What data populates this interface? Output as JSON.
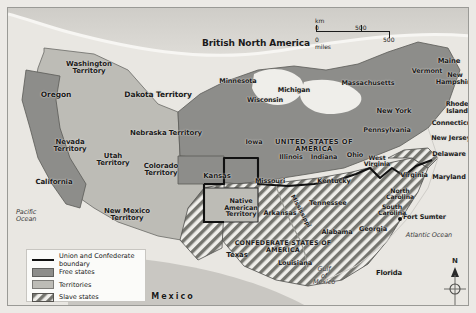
{
  "map": {
    "title_country_north": "British North America",
    "country_usa": "UNITED STATES OF AMERICA",
    "country_csa": "CONFEDERATE STATES OF AMERICA",
    "country_mexico": "Mexico",
    "oceans": [
      {
        "name": "Pacific Ocean",
        "label": "Pacific\nOcean"
      },
      {
        "name": "Atlantic Ocean",
        "label": "Atlantic Ocean"
      },
      {
        "name": "Gulf of Mexico",
        "label": "Gulf\nof\nMexico"
      }
    ],
    "river": "Mississippi",
    "marker": {
      "label": "Fort Sumter"
    },
    "free_states": [
      "Oregon",
      "California",
      "Minnesota",
      "Wisconsin",
      "Michigan",
      "Iowa",
      "Illinois",
      "Indiana",
      "Ohio",
      "Pennsylvania",
      "New York",
      "Vermont",
      "Massachusetts",
      "Maine",
      "New Hampshire",
      "Rhode Island",
      "Connecticut",
      "New Jersey",
      "Kansas",
      "West Virginia"
    ],
    "slave_states": [
      "Missouri",
      "Kentucky",
      "Tennessee",
      "Arkansas",
      "Louisiana",
      "Texas",
      "Mississippi",
      "Alabama",
      "Georgia",
      "Florida",
      "South Carolina",
      "North Carolina",
      "Virginia",
      "Maryland",
      "Delaware"
    ],
    "territories": [
      "Washington Territory",
      "Dakota Territory",
      "Nebraska Territory",
      "Nevada Territory",
      "Utah Territory",
      "Colorado Territory",
      "New Mexico Territory",
      "Native American Territory"
    ],
    "labels": [
      {
        "name": "washington-territory",
        "text": "Washington\nTerritory",
        "x": 50,
        "y": 53,
        "w": 62,
        "size": 7
      },
      {
        "name": "oregon",
        "text": "Oregon",
        "x": 20,
        "y": 83,
        "w": 56,
        "size": 7.5
      },
      {
        "name": "dakota-territory",
        "text": "Dakota Territory",
        "x": 108,
        "y": 83,
        "w": 84,
        "size": 7.5
      },
      {
        "name": "minnesota",
        "text": "Minnesota",
        "x": 203,
        "y": 70,
        "w": 54,
        "size": 6.5
      },
      {
        "name": "wisconsin",
        "text": "Wisconsin",
        "x": 232,
        "y": 89,
        "w": 50,
        "size": 6.5
      },
      {
        "name": "michigan",
        "text": "Michigan",
        "x": 262,
        "y": 79,
        "w": 48,
        "size": 6.5
      },
      {
        "name": "nebraska-territory",
        "text": "Nebraska Territory",
        "x": 112,
        "y": 122,
        "w": 92,
        "size": 7
      },
      {
        "name": "nevada-territory",
        "text": "Nevada\nTerritory",
        "x": 36,
        "y": 131,
        "w": 52,
        "size": 7
      },
      {
        "name": "utah-territory",
        "text": "Utah\nTerritory",
        "x": 80,
        "y": 145,
        "w": 50,
        "size": 7
      },
      {
        "name": "colorado-territory",
        "text": "Colorado\nTerritory",
        "x": 127,
        "y": 155,
        "w": 52,
        "size": 7
      },
      {
        "name": "kansas",
        "text": "Kansas",
        "x": 186,
        "y": 165,
        "w": 46,
        "size": 7
      },
      {
        "name": "iowa",
        "text": "Iowa",
        "x": 232,
        "y": 131,
        "w": 28,
        "size": 6.5
      },
      {
        "name": "california",
        "text": "California",
        "x": 20,
        "y": 171,
        "w": 52,
        "size": 7
      },
      {
        "name": "new-mexico-territory",
        "text": "New Mexico\nTerritory",
        "x": 86,
        "y": 200,
        "w": 66,
        "size": 7
      },
      {
        "name": "native-american-territory",
        "text": "Native\nAmerican\nTerritory",
        "x": 208,
        "y": 190,
        "w": 50,
        "size": 6.5
      },
      {
        "name": "illinois",
        "text": "Illinois",
        "x": 266,
        "y": 146,
        "w": 34,
        "size": 6.5
      },
      {
        "name": "indiana",
        "text": "Indiana",
        "x": 299,
        "y": 146,
        "w": 34,
        "size": 6.5
      },
      {
        "name": "ohio",
        "text": "Ohio",
        "x": 334,
        "y": 144,
        "w": 26,
        "size": 6.5
      },
      {
        "name": "missouri",
        "text": "Missouri",
        "x": 242,
        "y": 170,
        "w": 40,
        "size": 6.5
      },
      {
        "name": "kentucky",
        "text": "Kentucky",
        "x": 305,
        "y": 170,
        "w": 42,
        "size": 6.5
      },
      {
        "name": "west-virginia",
        "text": "West\nVirginia",
        "x": 352,
        "y": 147,
        "w": 34,
        "size": 6.2
      },
      {
        "name": "virginia",
        "text": "Virginia",
        "x": 388,
        "y": 164,
        "w": 36,
        "size": 6.5
      },
      {
        "name": "pennsylvania",
        "text": "Pennsylvania",
        "x": 348,
        "y": 119,
        "w": 62,
        "size": 6.5
      },
      {
        "name": "new-york",
        "text": "New York",
        "x": 363,
        "y": 100,
        "w": 46,
        "size": 6.8
      },
      {
        "name": "vermont",
        "text": "Vermont",
        "x": 398,
        "y": 60,
        "w": 42,
        "size": 6.5
      },
      {
        "name": "massachusetts",
        "text": "Massachusetts",
        "x": 329,
        "y": 72,
        "w": 62,
        "size": 6.5
      },
      {
        "name": "maine",
        "text": "Maine",
        "x": 424,
        "y": 50,
        "w": 34,
        "size": 6.8
      },
      {
        "name": "new-hampshire",
        "text": "New\nHampshire",
        "x": 424,
        "y": 64,
        "w": 46,
        "size": 6.5
      },
      {
        "name": "rhode-island",
        "text": "Rhode\nIsland",
        "x": 429,
        "y": 93,
        "w": 40,
        "size": 6.5
      },
      {
        "name": "connecticut",
        "text": "Connecticut",
        "x": 418,
        "y": 112,
        "w": 54,
        "size": 6.5
      },
      {
        "name": "new-jersey",
        "text": "New Jersey",
        "x": 418,
        "y": 127,
        "w": 50,
        "size": 6.5
      },
      {
        "name": "delaware",
        "text": "Delaware",
        "x": 418,
        "y": 143,
        "w": 46,
        "size": 6.5
      },
      {
        "name": "maryland",
        "text": "Maryland",
        "x": 418,
        "y": 166,
        "w": 46,
        "size": 6.5
      },
      {
        "name": "north-carolina",
        "text": "North\nCarolina",
        "x": 371,
        "y": 180,
        "w": 42,
        "size": 6.2
      },
      {
        "name": "south-carolina",
        "text": "South\nCarolina",
        "x": 363,
        "y": 196,
        "w": 42,
        "size": 6.2
      },
      {
        "name": "tennessee",
        "text": "Tennessee",
        "x": 296,
        "y": 192,
        "w": 48,
        "size": 6.5
      },
      {
        "name": "arkansas",
        "text": "Arkansas",
        "x": 251,
        "y": 202,
        "w": 42,
        "size": 6.5
      },
      {
        "name": "alabama",
        "text": "Alabama",
        "x": 308,
        "y": 221,
        "w": 42,
        "size": 6.5
      },
      {
        "name": "georgia",
        "text": "Georgia",
        "x": 345,
        "y": 218,
        "w": 40,
        "size": 6.5
      },
      {
        "name": "louisiana",
        "text": "Louisiana",
        "x": 265,
        "y": 252,
        "w": 44,
        "size": 6.5
      },
      {
        "name": "texas",
        "text": "Texas",
        "x": 212,
        "y": 244,
        "w": 34,
        "size": 7
      },
      {
        "name": "florida",
        "text": "Florida",
        "x": 363,
        "y": 262,
        "w": 36,
        "size": 6.8
      }
    ],
    "legend": {
      "title": "Legend",
      "items": [
        {
          "name": "boundary",
          "swatch": "line",
          "label": "Union and Confederate boundary"
        },
        {
          "name": "free-states",
          "swatch": "free",
          "label": "Free states"
        },
        {
          "name": "territories",
          "swatch": "terr",
          "label": "Territories"
        },
        {
          "name": "slave-states",
          "swatch": "slave",
          "label": "Slave states"
        }
      ]
    },
    "scale": {
      "km_unit": "km",
      "mi_unit": "miles",
      "zero": "0",
      "km_value": "500",
      "mi_value": "500"
    },
    "compass": {
      "north": "N"
    },
    "colors": {
      "free_states": "#8d8d8a",
      "territories": "#bdbcb6",
      "slave_states_hatch": "#6e6e6b",
      "water": "#efeeea",
      "boundary": "#111111",
      "land_outside": "#c9c7c2"
    }
  }
}
